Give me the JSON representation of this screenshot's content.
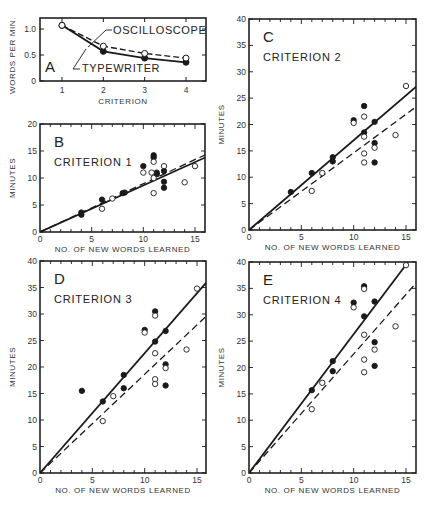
{
  "figure": {
    "x_axis_title": "NO. OF NEW WORDS LEARNED",
    "y_axis_title_minutes": "MINUTES"
  },
  "chart_data": [
    {
      "id": "A",
      "type": "line",
      "panel_label": "A",
      "title": "",
      "xlabel": "CRITERION",
      "ylabel": "WORDS PER MIN.",
      "categories": [
        1,
        2,
        3,
        4
      ],
      "xticks": [
        "1",
        "2",
        "3",
        "4"
      ],
      "yticks": [
        "0",
        "0.5",
        "1.0"
      ],
      "ylim": [
        0,
        1.2
      ],
      "grid": false,
      "series": [
        {
          "name": "OSCILLOSCOPE",
          "marker": "open-circle",
          "line": "dashed",
          "values": [
            1.07,
            0.67,
            0.53,
            0.44
          ]
        },
        {
          "name": "TYPEWRITER",
          "marker": "filled-circle",
          "line": "solid",
          "values": [
            1.07,
            0.57,
            0.44,
            0.36
          ]
        }
      ],
      "annotations": [
        "OSCILLOSCOPE",
        "TYPEWRITER"
      ]
    },
    {
      "id": "B",
      "type": "scatter",
      "panel_label": "B",
      "title": "CRITERION 1",
      "xlabel": "NO. OF NEW WORDS LEARNED",
      "ylabel": "MINUTES",
      "xlim": [
        0,
        16
      ],
      "ylim": [
        0,
        20
      ],
      "xticks": [
        "0",
        "5",
        "10",
        "15"
      ],
      "yticks": [
        "0",
        "5",
        "10",
        "15",
        "20"
      ],
      "grid": false,
      "series": [
        {
          "name": "Typewriter",
          "marker": "filled-circle",
          "points": [
            [
              4,
              3.2
            ],
            [
              4,
              3.6
            ],
            [
              6,
              6.0
            ],
            [
              8,
              7.2
            ],
            [
              8.2,
              7.3
            ],
            [
              10,
              12.2
            ],
            [
              11,
              14.2
            ],
            [
              11,
              13.8
            ],
            [
              11.3,
              11.0
            ],
            [
              11.3,
              10.7
            ],
            [
              12,
              9.3
            ],
            [
              12,
              8.2
            ],
            [
              12,
              11.3
            ]
          ]
        },
        {
          "name": "Oscilloscope",
          "marker": "open-circle",
          "points": [
            [
              6,
              4.3
            ],
            [
              7,
              6.2
            ],
            [
              10,
              11.0
            ],
            [
              10.8,
              11.0
            ],
            [
              11,
              13.0
            ],
            [
              11,
              10.0
            ],
            [
              11,
              7.2
            ],
            [
              12,
              12.2
            ],
            [
              14,
              9.2
            ],
            [
              15,
              12.2
            ]
          ]
        }
      ],
      "fit_lines": [
        {
          "name": "Typewriter fit",
          "line": "solid",
          "from": [
            0,
            0
          ],
          "to": [
            16,
            13.8
          ]
        },
        {
          "name": "Oscilloscope fit",
          "line": "dashed",
          "from": [
            0,
            0
          ],
          "to": [
            16,
            14.3
          ]
        }
      ]
    },
    {
      "id": "C",
      "type": "scatter",
      "panel_label": "C",
      "title": "CRITERION 2",
      "xlabel": "NO. OF NEW WORDS LEARNED",
      "ylabel": "MINUTES",
      "xlim": [
        0,
        16
      ],
      "ylim": [
        0,
        40
      ],
      "xticks": [
        "0",
        "5",
        "10",
        "15"
      ],
      "yticks": [
        "0",
        "5",
        "10",
        "15",
        "20",
        "25",
        "30",
        "35",
        "40"
      ],
      "grid": false,
      "series": [
        {
          "name": "Typewriter",
          "marker": "filled-circle",
          "points": [
            [
              4,
              7.2
            ],
            [
              6,
              10.8
            ],
            [
              8,
              13.8
            ],
            [
              8,
              13.0
            ],
            [
              10,
              20.8
            ],
            [
              11,
              23.5
            ],
            [
              11,
              18.5
            ],
            [
              12,
              20.5
            ],
            [
              12,
              16.5
            ],
            [
              12,
              12.8
            ]
          ]
        },
        {
          "name": "Oscilloscope",
          "marker": "open-circle",
          "points": [
            [
              6,
              7.4
            ],
            [
              7,
              10.8
            ],
            [
              10,
              20.3
            ],
            [
              11,
              21.5
            ],
            [
              11,
              17.7
            ],
            [
              11,
              14.5
            ],
            [
              11,
              12.8
            ],
            [
              12,
              15.6
            ],
            [
              14,
              18.0
            ],
            [
              15,
              27.3
            ]
          ]
        }
      ],
      "fit_lines": [
        {
          "name": "Typewriter fit",
          "line": "solid",
          "from": [
            0,
            0
          ],
          "to": [
            16,
            27.2
          ]
        },
        {
          "name": "Oscilloscope fit",
          "line": "dashed",
          "from": [
            0,
            0
          ],
          "to": [
            16,
            23.4
          ]
        }
      ]
    },
    {
      "id": "D",
      "type": "scatter",
      "panel_label": "D",
      "title": "CRITERION 3",
      "xlabel": "NO. OF NEW WORDS LEARNED",
      "ylabel": "MINUTES",
      "xlim": [
        0,
        16
      ],
      "ylim": [
        0,
        40
      ],
      "xticks": [
        "0",
        "5",
        "10",
        "15"
      ],
      "yticks": [
        "0",
        "5",
        "10",
        "15",
        "20",
        "25",
        "30",
        "35",
        "40"
      ],
      "grid": false,
      "series": [
        {
          "name": "Typewriter",
          "marker": "filled-circle",
          "points": [
            [
              4,
              15.5
            ],
            [
              6,
              13.5
            ],
            [
              8,
              18.5
            ],
            [
              8,
              16.0
            ],
            [
              10,
              27.0
            ],
            [
              11,
              30.5
            ],
            [
              11,
              24.8
            ],
            [
              12,
              26.8
            ],
            [
              12,
              20.5
            ],
            [
              12,
              16.5
            ]
          ]
        },
        {
          "name": "Oscilloscope",
          "marker": "open-circle",
          "points": [
            [
              6,
              9.8
            ],
            [
              7,
              14.5
            ],
            [
              10,
              26.5
            ],
            [
              11,
              29.7
            ],
            [
              11,
              22.6
            ],
            [
              11,
              17.7
            ],
            [
              11,
              16.8
            ],
            [
              12,
              19.8
            ],
            [
              14,
              23.3
            ],
            [
              15,
              34.8
            ]
          ]
        }
      ],
      "fit_lines": [
        {
          "name": "Typewriter fit",
          "line": "solid",
          "from": [
            0,
            0
          ],
          "to": [
            16,
            36.2
          ]
        },
        {
          "name": "Oscilloscope fit",
          "line": "dashed",
          "from": [
            0,
            0
          ],
          "to": [
            16,
            29.8
          ]
        }
      ]
    },
    {
      "id": "E",
      "type": "scatter",
      "panel_label": "E",
      "title": "CRITERION 4",
      "xlabel": "NO. OF NEW WORDS LEARNED",
      "ylabel": "MINUTES",
      "xlim": [
        0,
        16
      ],
      "ylim": [
        0,
        40
      ],
      "xticks": [
        "0",
        "5",
        "10",
        "15"
      ],
      "yticks": [
        "0",
        "5",
        "10",
        "15",
        "20",
        "25",
        "30",
        "35",
        "40"
      ],
      "grid": false,
      "series": [
        {
          "name": "Typewriter",
          "marker": "filled-circle",
          "points": [
            [
              6,
              15.7
            ],
            [
              8,
              21.2
            ],
            [
              8,
              19.3
            ],
            [
              10,
              32.3
            ],
            [
              11,
              35.4
            ],
            [
              11,
              29.7
            ],
            [
              12,
              32.5
            ],
            [
              12,
              24.8
            ],
            [
              12,
              20.3
            ]
          ]
        },
        {
          "name": "Oscilloscope",
          "marker": "open-circle",
          "points": [
            [
              6,
              12.1
            ],
            [
              7,
              17.1
            ],
            [
              10,
              31.4
            ],
            [
              11,
              34.9
            ],
            [
              11,
              26.2
            ],
            [
              11,
              21.5
            ],
            [
              11,
              19.1
            ],
            [
              12,
              23.4
            ],
            [
              14,
              27.8
            ],
            [
              15,
              39.4
            ]
          ]
        }
      ],
      "fit_lines": [
        {
          "name": "Typewriter fit",
          "line": "solid",
          "from": [
            0,
            0
          ],
          "to": [
            15.2,
            40
          ]
        },
        {
          "name": "Oscilloscope fit",
          "line": "dashed",
          "from": [
            0,
            0
          ],
          "to": [
            16,
            36.1
          ]
        }
      ]
    }
  ],
  "layout": {
    "panels": {
      "A": {
        "x0": 40,
        "x1": 206,
        "y0": 81,
        "y1": 18,
        "xmap": [
          1,
          62,
          4,
          186
        ],
        "ymap": [
          0,
          81,
          1.0,
          29
        ]
      },
      "B": {
        "x0": 40,
        "x1": 205,
        "y0": 232,
        "y1": 124,
        "xmap": [
          0,
          40,
          15,
          195
        ],
        "ymap": [
          0,
          232,
          20,
          124
        ]
      },
      "C": {
        "x0": 249,
        "x1": 416,
        "y0": 230,
        "y1": 19,
        "xmap": [
          0,
          249,
          15,
          406
        ],
        "ymap": [
          0,
          230,
          40,
          19
        ]
      },
      "D": {
        "x0": 40,
        "x1": 206,
        "y0": 473,
        "y1": 261,
        "xmap": [
          0,
          40,
          15,
          197
        ],
        "ymap": [
          0,
          473,
          40,
          261
        ]
      },
      "E": {
        "x0": 249,
        "x1": 416,
        "y0": 473,
        "y1": 262,
        "xmap": [
          0,
          249,
          15,
          406
        ],
        "ymap": [
          0,
          473,
          40,
          262
        ]
      }
    },
    "colors": {
      "ink": "#1a1a1a",
      "axis": "#222222",
      "text": "#333333",
      "background": "#ffffff"
    }
  }
}
